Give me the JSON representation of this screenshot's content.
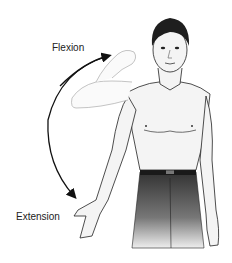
{
  "diagram": {
    "labels": {
      "flexion": "Flexion",
      "extension": "Extension"
    },
    "colors": {
      "background": "#ffffff",
      "outline": "#222222",
      "skin": "#f2f2f2",
      "hair": "#1e1e1e",
      "pants_top": "#3a3a3a",
      "pants_bottom": "#e8e8e8",
      "belt": "#1a1a1a",
      "arrow": "#111111"
    }
  }
}
